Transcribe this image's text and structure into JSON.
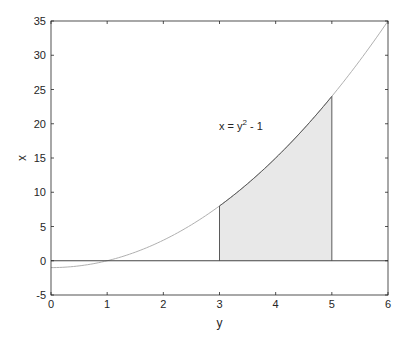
{
  "chart_data": {
    "type": "area",
    "title": "",
    "xlabel": "y",
    "ylabel": "x",
    "xlim": [
      0,
      6
    ],
    "ylim": [
      -5,
      35
    ],
    "xticks": [
      0,
      1,
      2,
      3,
      4,
      5,
      6
    ],
    "yticks": [
      -5,
      0,
      5,
      10,
      15,
      20,
      25,
      30,
      35
    ],
    "grid": false,
    "legend": null,
    "series": [
      {
        "name": "x = y^2 - 1",
        "kind": "line",
        "function": "y^2 - 1",
        "x": [
          0,
          0.5,
          1,
          1.5,
          2,
          2.5,
          3,
          3.5,
          4,
          4.5,
          5,
          5.5,
          6
        ],
        "y": [
          -1,
          -0.75,
          0,
          1.25,
          3,
          5.25,
          8,
          11.25,
          15,
          19.25,
          24,
          29.25,
          35
        ],
        "color": "#b0b0b0"
      },
      {
        "name": "shaded region",
        "kind": "area",
        "x_range": [
          3,
          5
        ],
        "upper": "y^2 - 1",
        "lower": 0,
        "fill": "#e8e8e8",
        "edge": "#5a5a5a"
      },
      {
        "name": "x = 0",
        "kind": "hline",
        "value": 0,
        "color": "#444444"
      }
    ],
    "annotations": [
      {
        "text": "x = y",
        "sup": "2",
        "tail": " - 1",
        "at": [
          3.0,
          20.0
        ]
      }
    ]
  },
  "axes": {
    "xlabel": "y",
    "ylabel": "x",
    "xtick_labels": [
      "0",
      "1",
      "2",
      "3",
      "4",
      "5",
      "6"
    ],
    "ytick_labels": [
      "-5",
      "0",
      "5",
      "10",
      "15",
      "20",
      "25",
      "30",
      "35"
    ]
  },
  "annotation": {
    "base": "x = y",
    "sup": "2",
    "tail": " - 1"
  }
}
